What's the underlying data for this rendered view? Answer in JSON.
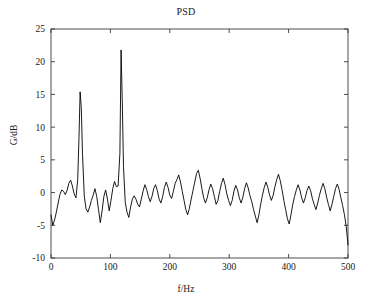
{
  "chart_data": {
    "type": "line",
    "title": "PSD",
    "xlabel": "f/Hz",
    "ylabel": "G/dB",
    "xlim": [
      0,
      500
    ],
    "ylim": [
      -10,
      25
    ],
    "xticks": [
      0,
      100,
      200,
      300,
      400,
      500
    ],
    "yticks": [
      -10,
      -5,
      0,
      5,
      10,
      15,
      20,
      25
    ],
    "xtick_labels": [
      "0",
      "100",
      "200",
      "300",
      "400",
      "500"
    ],
    "ytick_labels": [
      "-10",
      "-5",
      "0",
      "5",
      "10",
      "15",
      "20",
      "25"
    ],
    "grid": false,
    "legend": null,
    "line_color": "#000000",
    "line_width": 0.9,
    "annotations": [
      {
        "label": "peak 1",
        "x": 49,
        "y": 15.4
      },
      {
        "label": "peak 2",
        "x": 118,
        "y": 21.8
      }
    ],
    "series": [
      {
        "name": "PSD",
        "x": [
          0,
          3,
          6,
          9,
          12,
          15,
          18,
          21,
          24,
          27,
          30,
          33,
          36,
          39,
          42,
          45,
          47,
          49,
          51,
          53,
          56,
          59,
          62,
          65,
          68,
          71,
          74,
          77,
          80,
          83,
          86,
          89,
          92,
          95,
          98,
          101,
          104,
          107,
          110,
          113,
          116,
          118,
          120,
          122,
          125,
          128,
          131,
          134,
          137,
          140,
          143,
          146,
          149,
          152,
          155,
          158,
          161,
          164,
          167,
          170,
          173,
          176,
          179,
          182,
          185,
          188,
          191,
          194,
          197,
          200,
          203,
          206,
          209,
          212,
          215,
          218,
          221,
          224,
          227,
          230,
          233,
          236,
          239,
          242,
          245,
          248,
          251,
          254,
          257,
          260,
          263,
          266,
          269,
          272,
          275,
          278,
          281,
          284,
          287,
          290,
          293,
          296,
          299,
          302,
          305,
          308,
          311,
          314,
          317,
          320,
          323,
          326,
          329,
          332,
          335,
          338,
          341,
          344,
          347,
          350,
          353,
          356,
          359,
          362,
          365,
          368,
          371,
          374,
          377,
          380,
          383,
          386,
          389,
          392,
          395,
          398,
          401,
          404,
          407,
          410,
          413,
          416,
          419,
          422,
          425,
          428,
          431,
          434,
          437,
          440,
          443,
          446,
          449,
          452,
          455,
          458,
          461,
          464,
          467,
          470,
          473,
          476,
          479,
          482,
          485,
          488,
          491,
          494,
          497,
          500
        ],
        "y": [
          -3.4,
          -5.0,
          -4.2,
          -3.0,
          -1.6,
          -0.3,
          0.4,
          0.2,
          -0.3,
          0.3,
          1.4,
          1.9,
          1.0,
          -0.2,
          -0.8,
          2.0,
          8.0,
          15.4,
          13.0,
          6.0,
          -0.5,
          -2.5,
          -3.0,
          -2.2,
          -1.2,
          -0.4,
          0.6,
          -0.6,
          -2.6,
          -4.6,
          -2.8,
          -0.6,
          0.4,
          -1.0,
          -2.8,
          -1.2,
          0.6,
          1.7,
          0.9,
          1.0,
          6.0,
          21.8,
          14.0,
          4.0,
          -1.5,
          -3.0,
          -3.8,
          -2.2,
          -1.0,
          -0.5,
          -1.0,
          -1.8,
          -2.2,
          -1.0,
          0.2,
          1.2,
          0.5,
          -0.6,
          -1.4,
          -0.6,
          0.6,
          1.2,
          0.3,
          -1.0,
          -1.6,
          -0.6,
          0.8,
          1.6,
          0.8,
          -0.4,
          -0.9,
          0.2,
          1.4,
          2.0,
          2.7,
          1.6,
          0.2,
          -1.2,
          -2.6,
          -3.4,
          -2.4,
          -1.0,
          0.3,
          1.6,
          2.9,
          3.4,
          2.2,
          0.6,
          -0.8,
          -1.6,
          -0.8,
          0.4,
          1.3,
          0.6,
          -0.6,
          -1.8,
          -1.2,
          0.2,
          1.4,
          2.2,
          1.2,
          -0.2,
          -1.2,
          -2.0,
          -1.2,
          0.2,
          1.1,
          0.4,
          -0.8,
          -1.6,
          -0.7,
          0.6,
          1.5,
          0.7,
          -0.5,
          -1.4,
          -2.6,
          -3.6,
          -4.6,
          -3.4,
          -1.8,
          -0.4,
          0.8,
          1.6,
          0.8,
          -0.4,
          -1.2,
          -0.4,
          0.9,
          2.0,
          2.8,
          1.8,
          0.4,
          -1.2,
          -2.6,
          -4.0,
          -4.8,
          -3.4,
          -1.8,
          -0.6,
          0.4,
          1.2,
          0.4,
          -0.8,
          -1.6,
          -0.8,
          0.3,
          1.0,
          0.3,
          -0.9,
          -1.8,
          -2.6,
          -1.6,
          -0.4,
          0.6,
          1.4,
          0.6,
          -0.7,
          -1.8,
          -2.8,
          -1.8,
          -0.6,
          0.6,
          1.3,
          0.5,
          -0.8,
          -2.0,
          -3.4,
          -5.2,
          -8.0
        ]
      }
    ]
  }
}
